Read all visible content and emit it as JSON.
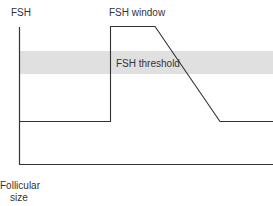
{
  "diagram": {
    "y_axis_label": "FSH",
    "x_axis_label_line1": "Follicular",
    "x_axis_label_line2": "size",
    "window_label": "FSH window",
    "threshold_label": "FSH threshold",
    "colors": {
      "line": "#333333",
      "threshold_band": "#e0e0e0",
      "background": "#ffffff"
    }
  }
}
